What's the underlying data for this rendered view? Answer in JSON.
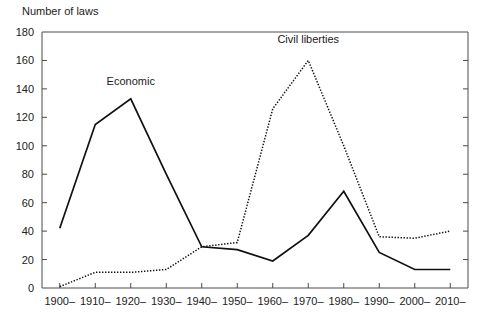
{
  "chart_data": {
    "type": "line",
    "title": "",
    "ylabel": "Number of laws",
    "xlabel": "",
    "ylim": [
      0,
      180
    ],
    "yticks": [
      0,
      20,
      40,
      60,
      80,
      100,
      120,
      140,
      160,
      180
    ],
    "grid": false,
    "legend_position": "inline-annotation",
    "categories": [
      "1900–",
      "1910–",
      "1920–",
      "1930–",
      "1940–",
      "1950–",
      "1960–",
      "1970–",
      "1980–",
      "1990–",
      "2000–",
      "2010–"
    ],
    "series": [
      {
        "name": "Economic",
        "style": "solid",
        "color": "#111111",
        "values": [
          42,
          115,
          133,
          80,
          29,
          27,
          19,
          37,
          68,
          25,
          13,
          13
        ],
        "annotation": {
          "text": "Economic",
          "x_category": "1920–",
          "y_value": 143
        }
      },
      {
        "name": "Civil liberties",
        "style": "dotted",
        "color": "#111111",
        "values": [
          1,
          11,
          11,
          13,
          29,
          32,
          126,
          160,
          100,
          36,
          35,
          40
        ],
        "annotation": {
          "text": "Civil liberties",
          "x_category": "1970–",
          "y_value": 172
        }
      }
    ]
  },
  "axis": {
    "y_title": "Number of laws",
    "y_tick_labels": [
      "0",
      "20",
      "40",
      "60",
      "80",
      "100",
      "120",
      "140",
      "160",
      "180"
    ],
    "x_tick_labels": [
      "1900–",
      "1910–",
      "1920–",
      "1930–",
      "1940–",
      "1950–",
      "1960–",
      "1970–",
      "1980–",
      "1990–",
      "2000–",
      "2010–"
    ]
  },
  "annotations": {
    "economic_label": "Economic",
    "civil_liberties_label": "Civil liberties"
  },
  "colors": {
    "axis": "#4a4a4a",
    "line": "#111111",
    "text": "#222222",
    "background": "#ffffff"
  }
}
